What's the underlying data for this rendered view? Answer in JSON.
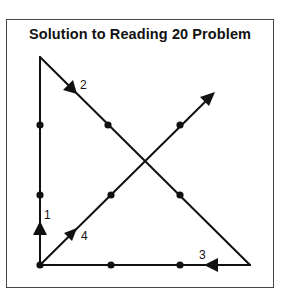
{
  "title": "Solution to Reading 20 Problem",
  "colors": {
    "ink": "#111111",
    "frame": "#444444",
    "background": "#ffffff"
  },
  "grid_dots": [
    {
      "x": 40,
      "y": 125
    },
    {
      "x": 110,
      "y": 125
    },
    {
      "x": 180,
      "y": 125
    },
    {
      "x": 40,
      "y": 195
    },
    {
      "x": 110,
      "y": 195
    },
    {
      "x": 180,
      "y": 195
    },
    {
      "x": 40,
      "y": 265
    },
    {
      "x": 110,
      "y": 265
    },
    {
      "x": 180,
      "y": 265
    }
  ],
  "path_segments": [
    {
      "label": "1",
      "from": [
        40,
        265
      ],
      "to": [
        40,
        57
      ],
      "direction": "up"
    },
    {
      "label": "2",
      "from": [
        40,
        57
      ],
      "to": [
        250,
        265
      ],
      "direction": "down-right"
    },
    {
      "label": "3",
      "from": [
        250,
        265
      ],
      "to": [
        40,
        265
      ],
      "direction": "left"
    },
    {
      "label": "4",
      "from": [
        40,
        265
      ],
      "to": [
        214,
        93
      ],
      "direction": "up-right"
    }
  ],
  "labels": {
    "seg1": "1",
    "seg2": "2",
    "seg3": "3",
    "seg4": "4"
  }
}
